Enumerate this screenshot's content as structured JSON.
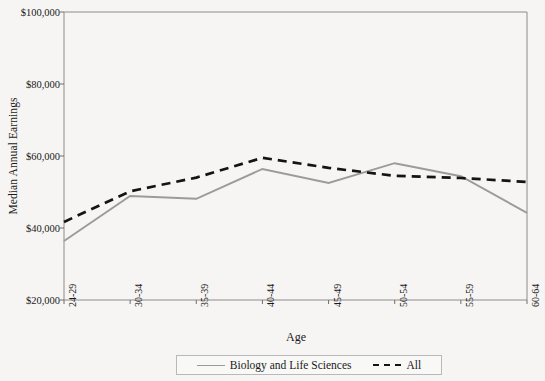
{
  "chart_data": {
    "type": "line",
    "title": "",
    "xlabel": "Age",
    "ylabel": "Median Annual Earnings",
    "categories": [
      "24-29",
      "30-34",
      "35-39",
      "40-44",
      "45-49",
      "50-54",
      "55-59",
      "60-64"
    ],
    "ylim": [
      20000,
      100000
    ],
    "ytick_values": [
      20000,
      40000,
      60000,
      80000,
      100000
    ],
    "ytick_labels": [
      "$20,000",
      "$40,000",
      "$60,000",
      "$80,000",
      "$100,000"
    ],
    "grid": false,
    "legend_position": "bottom-center",
    "series": [
      {
        "name": "Biology and Life Sciences",
        "style": "solid",
        "color": "#9b9b9b",
        "values": [
          36400,
          48900,
          48100,
          56400,
          52500,
          58000,
          54400,
          44200
        ]
      },
      {
        "name": "All",
        "style": "dashed",
        "color": "#141414",
        "values": [
          41700,
          50200,
          54000,
          59500,
          56700,
          54500,
          53900,
          52800
        ]
      }
    ]
  },
  "axes": {
    "y_title": "Median Annual Earnings",
    "x_title": "Age",
    "y_ticks": [
      "$100,000",
      "$80,000",
      "$60,000",
      "$40,000",
      "$20,000"
    ],
    "x_ticks": [
      "24-29",
      "30-34",
      "35-39",
      "40-44",
      "45-49",
      "50-54",
      "55-59",
      "60-64"
    ]
  },
  "legend": {
    "entries": [
      {
        "label": "Biology and Life Sciences",
        "style": "solid"
      },
      {
        "label": "All",
        "style": "dashed"
      }
    ]
  },
  "colors": {
    "series_biology": "#9b9b9b",
    "series_all": "#141414",
    "axis": "#8c8c8c",
    "background": "#f6f5f3"
  }
}
